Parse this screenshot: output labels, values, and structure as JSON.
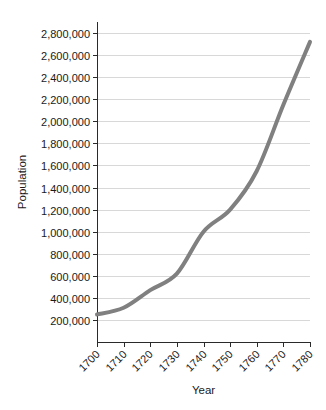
{
  "chart_data": {
    "type": "line",
    "title": "",
    "xlabel": "Year",
    "ylabel": "Population",
    "x": [
      1700,
      1710,
      1720,
      1730,
      1740,
      1750,
      1760,
      1770,
      1780
    ],
    "values": [
      250000,
      310000,
      470000,
      620000,
      1000000,
      1200000,
      1550000,
      2150000,
      2720000
    ],
    "series": [
      {
        "name": "Population",
        "values": [
          250000,
          310000,
          470000,
          620000,
          1000000,
          1200000,
          1550000,
          2150000,
          2720000
        ]
      }
    ],
    "xlim": [
      1700,
      1780
    ],
    "ylim": [
      0,
      2900000
    ],
    "xtick_labels": [
      "1700",
      "1710",
      "1720",
      "1730",
      "1740",
      "1750",
      "1760",
      "1770",
      "1780"
    ],
    "ytick_values": [
      200000,
      400000,
      600000,
      800000,
      1000000,
      1200000,
      1400000,
      1600000,
      1800000,
      2000000,
      2200000,
      2400000,
      2600000,
      2800000
    ],
    "ytick_labels": [
      "200,000",
      "400,000",
      "600,000",
      "800,000",
      "1,000,000",
      "1,200,000",
      "1,400,000",
      "1,600,000",
      "1,800,000",
      "2,000,000",
      "2,200,000",
      "2,400,000",
      "2,600,000",
      "2,800,000"
    ],
    "grid": true,
    "grid_axis": "y",
    "legend": false,
    "legend_position": "none",
    "line_color": "#808080",
    "grid_color": "#d8d8d8",
    "axis_color": "#2a2a2a",
    "background_color": "#ffffff",
    "xtick_label_rotation": 45
  },
  "layout": {
    "plot_left": 97,
    "plot_right": 310,
    "plot_top": 22,
    "plot_bottom": 342,
    "y_value_at_bottom": 0,
    "y_pixels_per_unit": 0.0001005
  }
}
